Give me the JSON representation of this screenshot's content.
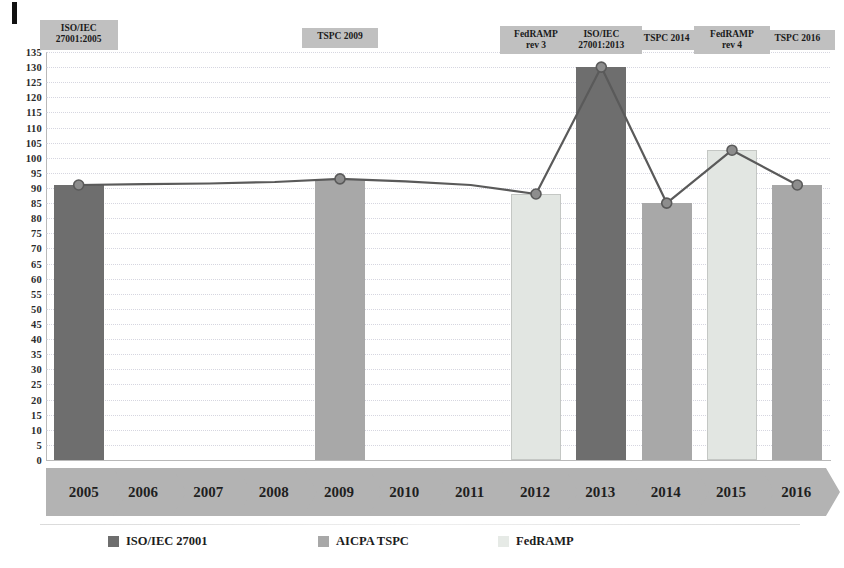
{
  "chart_data": {
    "type": "bar",
    "title": "",
    "xlabel": "",
    "ylabel": "",
    "ylim": [
      0,
      135
    ],
    "ytick_step": 5,
    "grid": true,
    "legend_position": "bottom",
    "categories": [
      "2005",
      "2006",
      "2007",
      "2008",
      "2009",
      "2010",
      "2011",
      "2012",
      "2013",
      "2014",
      "2015",
      "2016"
    ],
    "yticks": [
      "135",
      "130",
      "125",
      "120",
      "115",
      "110",
      "105",
      "100",
      "95",
      "90",
      "85",
      "80",
      "75",
      "70",
      "65",
      "60",
      "55",
      "50",
      "45",
      "40",
      "35",
      "30",
      "25",
      "20",
      "15",
      "10",
      "5",
      "0"
    ],
    "series": [
      {
        "name": "ISO/IEC 27001",
        "color": "#6e6e6e",
        "values": [
          91,
          null,
          null,
          null,
          null,
          null,
          null,
          null,
          130,
          null,
          null,
          null
        ]
      },
      {
        "name": "AICPA TSPC",
        "color": "#a8a8a8",
        "values": [
          null,
          null,
          null,
          null,
          93,
          null,
          null,
          null,
          null,
          85,
          null,
          91
        ]
      },
      {
        "name": "FedRAMP",
        "color": "#e6eae6",
        "values": [
          null,
          null,
          null,
          null,
          null,
          null,
          null,
          88,
          null,
          null,
          102.5,
          null
        ]
      }
    ],
    "line_series": {
      "name": "trend",
      "color": "#5a5a5a",
      "x": [
        "2005",
        "2006",
        "2007",
        "2008",
        "2009",
        "2010",
        "2011",
        "2012",
        "2013",
        "2014",
        "2015",
        "2016"
      ],
      "values": [
        91,
        91.3,
        91.5,
        92,
        93,
        92.2,
        91,
        88,
        130,
        85,
        102.5,
        91
      ],
      "markers": [
        "2005",
        "2009",
        "2012",
        "2013",
        "2014",
        "2015",
        "2016"
      ]
    },
    "annotations": [
      {
        "label": "ISO/IEC\n27001:2005",
        "at": "2005"
      },
      {
        "label": "TSPC 2009",
        "at": "2009"
      },
      {
        "label": "FedRAMP\nrev 3",
        "at": "2012"
      },
      {
        "label": "ISO/IEC\n27001:2013",
        "at": "2013"
      },
      {
        "label": "TSPC 2014",
        "at": "2014"
      },
      {
        "label": "FedRAMP\nrev 4",
        "at": "2015"
      },
      {
        "label": "TSPC 2016",
        "at": "2016"
      }
    ],
    "legend": [
      {
        "label": "ISO/IEC 27001",
        "color": "#6e6e6e"
      },
      {
        "label": "AICPA TSPC",
        "color": "#a8a8a8"
      },
      {
        "label": "FedRAMP",
        "color": "#e6eae6"
      }
    ]
  },
  "colors": {
    "iso": "#6e6e6e",
    "tspc": "#a8a8a8",
    "fedramp": "#e6eae6",
    "annotation_bg": "#c0c0c0",
    "chevron_bg": "#b3b3b3",
    "line": "#5a5a5a",
    "grid": "#c9c9d6"
  }
}
